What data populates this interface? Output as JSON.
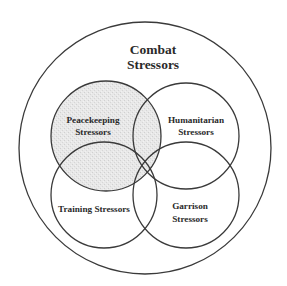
{
  "diagram": {
    "type": "venn",
    "colors": {
      "stroke": "#3a3a3a",
      "text": "#2a2a2a",
      "shaded_fill": "#e6e6e6",
      "background": "#ffffff"
    },
    "outer": {
      "label_line1": "Combat",
      "label_line2": "Stressors"
    },
    "sets": [
      {
        "id": "peacekeeping",
        "label_line1": "Peacekeeping",
        "label_line2": "Stressors",
        "shaded": true
      },
      {
        "id": "humanitarian",
        "label_line1": "Humanitarian",
        "label_line2": "Stressors",
        "shaded": false
      },
      {
        "id": "training",
        "label_line1": "Training Stressors",
        "label_line2": "",
        "shaded": false
      },
      {
        "id": "garrison",
        "label_line1": "Garrison",
        "label_line2": "Stressors",
        "shaded": false
      }
    ]
  }
}
